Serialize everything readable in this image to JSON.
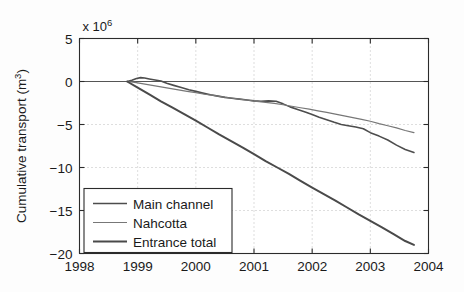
{
  "chart_data": {
    "type": "line",
    "title": "",
    "xlabel": "",
    "ylabel": "Cumulative transport (m",
    "ylabel_sup": "3",
    "ylabel_suffix": ")",
    "y_exponent_label": "x 10",
    "y_exponent_power": "6",
    "xlim": [
      1998,
      2004
    ],
    "ylim": [
      -20,
      5
    ],
    "grid": "dotted",
    "legend_position": "lower-left",
    "xticks": [
      "1998",
      "1999",
      "2000",
      "2001",
      "2002",
      "2003",
      "2004"
    ],
    "xtick_values": [
      1998,
      1999,
      2000,
      2001,
      2002,
      2003,
      2004
    ],
    "yticks": [
      "5",
      "0",
      "-5",
      "-10",
      "-15",
      "-20"
    ],
    "ytick_values": [
      5,
      0,
      -5,
      -10,
      -15,
      -20
    ],
    "zero_line": true,
    "series": [
      {
        "name": "Main channel",
        "color": "#4d4d4d",
        "width": 1.6,
        "x": [
          1998.82,
          1998.9,
          1998.98,
          1999.05,
          1999.12,
          1999.2,
          1999.3,
          1999.4,
          1999.5,
          1999.62,
          1999.75,
          1999.88,
          2000.0,
          2000.12,
          2000.25,
          2000.38,
          2000.5,
          2000.62,
          2000.75,
          2000.88,
          2001.0,
          2001.12,
          2001.25,
          2001.38,
          2001.5,
          2001.62,
          2001.75,
          2001.88,
          2002.0,
          2002.12,
          2002.25,
          2002.38,
          2002.5,
          2002.62,
          2002.75,
          2002.88,
          2003.0,
          2003.15,
          2003.3,
          2003.45,
          2003.6,
          2003.75
        ],
        "y": [
          0.0,
          0.15,
          0.35,
          0.45,
          0.4,
          0.3,
          0.18,
          0.05,
          -0.2,
          -0.45,
          -0.7,
          -0.95,
          -1.15,
          -1.35,
          -1.55,
          -1.7,
          -1.85,
          -1.95,
          -2.05,
          -2.15,
          -2.25,
          -2.3,
          -2.25,
          -2.3,
          -2.6,
          -2.95,
          -3.25,
          -3.55,
          -3.85,
          -4.15,
          -4.45,
          -4.75,
          -5.0,
          -5.15,
          -5.3,
          -5.5,
          -5.95,
          -6.35,
          -6.8,
          -7.4,
          -7.9,
          -8.25
        ]
      },
      {
        "name": "Nahcotta",
        "color": "#777777",
        "width": 1.2,
        "x": [
          1998.82,
          1998.95,
          1999.1,
          1999.25,
          1999.4,
          1999.55,
          1999.7,
          1999.85,
          2000.0,
          2000.15,
          2000.3,
          2000.45,
          2000.6,
          2000.75,
          2000.9,
          2001.05,
          2001.2,
          2001.35,
          2001.5,
          2001.65,
          2001.8,
          2001.95,
          2002.1,
          2002.25,
          2002.4,
          2002.55,
          2002.7,
          2002.85,
          2003.0,
          2003.15,
          2003.3,
          2003.45,
          2003.6,
          2003.75
        ],
        "y": [
          0.0,
          -0.1,
          -0.28,
          -0.45,
          -0.62,
          -0.8,
          -0.98,
          -1.15,
          -1.3,
          -1.48,
          -1.62,
          -1.78,
          -1.92,
          -2.05,
          -2.18,
          -2.3,
          -2.42,
          -2.55,
          -2.7,
          -2.88,
          -3.05,
          -3.22,
          -3.42,
          -3.6,
          -3.8,
          -4.0,
          -4.2,
          -4.4,
          -4.62,
          -4.9,
          -5.15,
          -5.4,
          -5.7,
          -5.95
        ]
      },
      {
        "name": "Entrance total",
        "color": "#4a4a4a",
        "width": 2.0,
        "x": [
          1998.82,
          1999.0,
          1999.2,
          1999.4,
          1999.6,
          1999.8,
          2000.0,
          2000.2,
          2000.4,
          2000.6,
          2000.8,
          2001.0,
          2001.2,
          2001.4,
          2001.6,
          2001.8,
          2002.0,
          2002.2,
          2002.4,
          2002.6,
          2002.8,
          2003.0,
          2003.2,
          2003.4,
          2003.6,
          2003.75
        ],
        "y": [
          0.0,
          -0.7,
          -1.5,
          -2.3,
          -3.05,
          -3.8,
          -4.55,
          -5.35,
          -6.15,
          -6.9,
          -7.65,
          -8.45,
          -9.25,
          -10.0,
          -10.75,
          -11.55,
          -12.35,
          -13.1,
          -13.85,
          -14.65,
          -15.45,
          -16.2,
          -16.95,
          -17.75,
          -18.55,
          -19.0
        ]
      }
    ],
    "legend_entries": [
      {
        "label": "Main channel",
        "color": "#4d4d4d",
        "width": 1.6
      },
      {
        "label": "Nahcotta",
        "color": "#777777",
        "width": 1.2
      },
      {
        "label": "Entrance total",
        "color": "#4a4a4a",
        "width": 2.0
      }
    ]
  }
}
